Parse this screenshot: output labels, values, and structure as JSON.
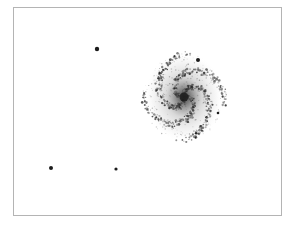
{
  "image": {
    "width": 296,
    "height": 226,
    "background": "#ffffff",
    "frame": {
      "x": 13,
      "y": 7,
      "w": 269,
      "h": 209,
      "color": "#b4b4b4"
    },
    "subject": "inverted spiral galaxy with foreground stars",
    "galaxy": {
      "cx": 184,
      "cy": 97,
      "rx": 40,
      "ry": 45,
      "core_color": "#1a1a1a",
      "halo_color": "#8a8a8a"
    },
    "stars": [
      {
        "x": 97,
        "y": 49,
        "r": 2.2
      },
      {
        "x": 198,
        "y": 60,
        "r": 2.0
      },
      {
        "x": 218,
        "y": 113,
        "r": 1.3
      },
      {
        "x": 51,
        "y": 168,
        "r": 2.0
      },
      {
        "x": 116,
        "y": 169,
        "r": 1.6
      }
    ]
  }
}
